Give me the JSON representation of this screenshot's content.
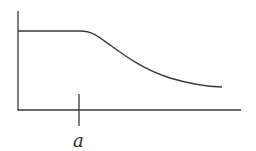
{
  "diagram": {
    "type": "function-sketch",
    "colors": {
      "line": "#3a3a3a",
      "background": "#ffffff"
    },
    "axes": {
      "origin": [
        18,
        110
      ],
      "y_axis_top": [
        18,
        11
      ],
      "x_axis_end": [
        241,
        110
      ]
    },
    "x_tick": {
      "label": "a",
      "x": 79,
      "y_top": 94,
      "y_bottom": 126
    },
    "curve": {
      "plateau_start": [
        18,
        31
      ],
      "plateau_end": [
        80,
        31
      ],
      "end": [
        222,
        87
      ]
    }
  }
}
